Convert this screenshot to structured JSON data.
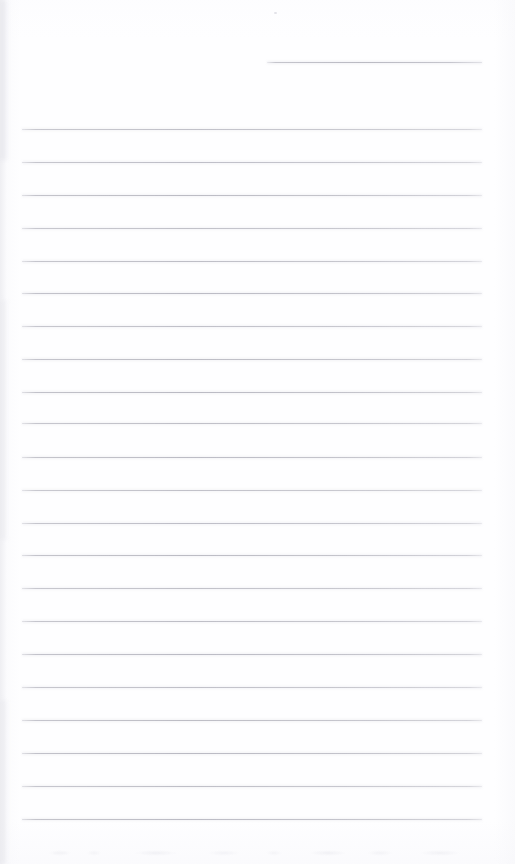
{
  "page": {
    "kind": "scanned-blank-lined-page",
    "width": 515,
    "height": 864,
    "background_color": "#fefeff",
    "rule_color": "#b5b5be",
    "visible_text": "",
    "note": "Blank ruled notepad page; no legible text is present in the image."
  },
  "header_rule": {
    "label": "",
    "x_start": 267,
    "x_end": 482,
    "y": 62,
    "thickness": 1
  },
  "body_rules": {
    "x_start": 22,
    "x_end": 482,
    "thickness": 1,
    "spacing": 32.7,
    "count": 22,
    "y_positions": [
      129,
      161.5,
      194.5,
      227.5,
      260.5,
      293,
      326,
      359,
      392,
      423,
      456.5,
      489.5,
      522.5,
      555,
      588,
      621,
      654,
      687,
      720,
      753,
      786,
      819
    ]
  },
  "artifacts": {
    "bleed_through_y": 846,
    "edge_shadow_side": "left",
    "speck": {
      "x": 274,
      "y": 12
    }
  }
}
